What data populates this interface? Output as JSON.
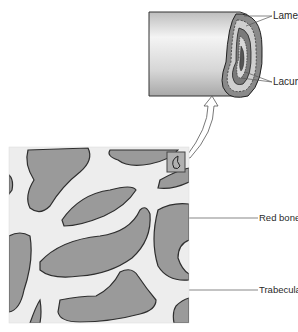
{
  "diagram": {
    "labels": {
      "lamellae": "Lamellae",
      "lacunae": "Lacunae",
      "red_bone_marrow": "Red bone marrow",
      "trabeculae": "Trabeculae"
    },
    "colors": {
      "background": "#ffffff",
      "bone_matrix": "#ededed",
      "marrow_fill": "#9a9a9a",
      "marrow_shadow": "#6f6f6f",
      "outline": "#2e2e2e",
      "leader_line": "#555555"
    }
  }
}
